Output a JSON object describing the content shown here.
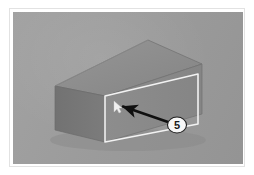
{
  "figure": {
    "title": "Isometric box with highlighted face and callout",
    "kind": "technical-illustration-photo",
    "plate": {
      "background_color": "#9d9d9d",
      "paper_color": "#ffffff",
      "frame_color": "#e2e2e2",
      "x": 13,
      "y": 12,
      "width": 230,
      "height": 152
    }
  },
  "object": {
    "name": "rectangular-prism",
    "faces": {
      "top": {
        "label": "top-face",
        "color": "#8e8e8e"
      },
      "front": {
        "label": "front-face",
        "color": "#8a8a8a"
      },
      "left_end": {
        "label": "left-end-face",
        "color": "#767676"
      }
    },
    "edge_color": "#6f6f6f"
  },
  "highlight": {
    "name": "highlighted-front-face-outline",
    "color": "#f2f2f2",
    "stroke_width": 1.6,
    "points": "105,116 105,96 198,74 198,124 105,142"
  },
  "pointer": {
    "name": "white-cursor-marker",
    "color": "#f0f0f0",
    "x": 116,
    "y": 105
  },
  "arrow": {
    "name": "callout-arrow",
    "color": "#101010",
    "tail_x": 168,
    "tail_y": 122,
    "tip_x": 120,
    "tip_y": 106,
    "stroke_width": 2.6
  },
  "callout": {
    "label": "5",
    "badge_fill": "#f7f7f7",
    "badge_stroke": "#1f1f1f",
    "text_color": "#1a1a1a",
    "cx": 177,
    "cy": 125,
    "rx": 9.5,
    "ry": 8
  }
}
